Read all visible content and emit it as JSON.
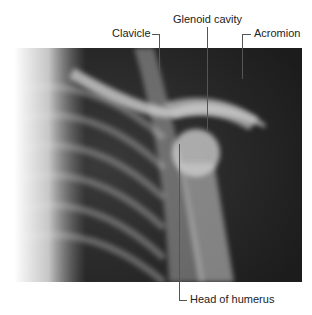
{
  "figure": {
    "type": "shoulder x-ray",
    "labels": {
      "clavicle": "Clavicle",
      "glenoid": "Glenoid cavity",
      "acromion": "Acromion",
      "humerus": "Head of humerus"
    }
  }
}
